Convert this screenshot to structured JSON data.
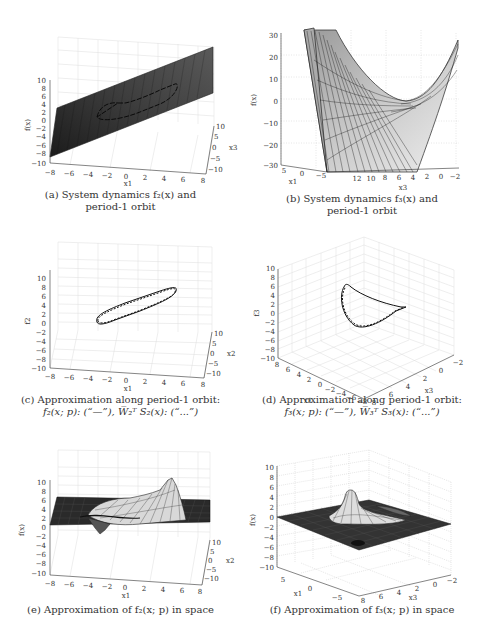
{
  "figure": {
    "panels": [
      {
        "id": "a",
        "caption_line1": "(a) System dynamics f₂(x) and",
        "caption_line2": "period-1 orbit",
        "zlabel": "f(x)",
        "xlabel": "x1",
        "ylabel": "x3",
        "zticks": [
          "10",
          "8",
          "6",
          "4",
          "2",
          "0",
          "−2",
          "−4",
          "−6",
          "−8",
          "−10"
        ],
        "xticks": [
          "−8",
          "−6",
          "−4",
          "−2",
          "0",
          "2",
          "4",
          "6",
          "8"
        ],
        "yticks": [
          "10",
          "5",
          "0",
          "−5",
          "−10"
        ]
      },
      {
        "id": "b",
        "caption_line1": "(b) System dynamics f₃(x) and",
        "caption_line2": "period-1 orbit",
        "zlabel": "f(x)",
        "xlabel": "x1",
        "ylabel": "x3",
        "zticks": [
          "30",
          "20",
          "10",
          "0",
          "−10",
          "−20",
          "−30"
        ],
        "xticks": [
          "5",
          "0",
          "−5"
        ],
        "yticks": [
          "12",
          "10",
          "8",
          "6",
          "4",
          "2",
          "0",
          "−2"
        ]
      },
      {
        "id": "c",
        "caption_line1": "(c) Approximation along period-1 orbit:",
        "caption_line2": "f₂(x; p): (“—”), W̅₂ᵀ S₂(x): (“...”)",
        "zlabel": "f2",
        "xlabel": "x1",
        "ylabel": "x2",
        "zticks": [
          "10",
          "8",
          "6",
          "4",
          "2",
          "0",
          "−2",
          "−4",
          "−6",
          "−8",
          "−10"
        ],
        "xticks": [
          "−8",
          "−6",
          "−4",
          "−2",
          "0",
          "2",
          "4",
          "6",
          "8"
        ],
        "yticks": [
          "10",
          "5",
          "0",
          "−5",
          "−10"
        ]
      },
      {
        "id": "d",
        "caption_line1": "(d) Approximation along period-1 orbit:",
        "caption_line2": "f₃(x; p): (“—”), W̅₃ᵀ S₃(x): (“...”)",
        "zlabel": "f3",
        "xlabel": "x1",
        "ylabel": "x3",
        "zticks": [
          "10",
          "8",
          "6",
          "4",
          "2",
          "0",
          "−2",
          "−4",
          "−6",
          "−8",
          "−10"
        ],
        "xticks": [
          "8",
          "6",
          "4",
          "2",
          "0",
          "−2",
          "−4",
          "−6",
          "−8"
        ],
        "yticks": [
          "8",
          "6",
          "4",
          "2",
          "0",
          "−2"
        ]
      },
      {
        "id": "e",
        "caption_line1": "(e) Approximation of f₂(x; p) in space",
        "caption_line2": "",
        "zlabel": "f(x)",
        "xlabel": "x1",
        "ylabel": "x2",
        "zticks": [
          "10",
          "8",
          "6",
          "4",
          "2",
          "0",
          "−2",
          "−4",
          "−6",
          "−8",
          "−10"
        ],
        "xticks": [
          "−8",
          "−6",
          "−4",
          "−2",
          "0",
          "2",
          "4",
          "6",
          "8"
        ],
        "yticks": [
          "10",
          "5",
          "0",
          "−5",
          "−10"
        ]
      },
      {
        "id": "f",
        "caption_line1": "(f) Approximation of f₃(x; p) in space",
        "caption_line2": "",
        "zlabel": "f(x)",
        "xlabel": "x1",
        "ylabel": "x3",
        "zticks": [
          "10",
          "8",
          "6",
          "4",
          "2",
          "0",
          "−2",
          "−4",
          "−6",
          "−8",
          "−10"
        ],
        "xticks": [
          "5",
          "0",
          "−5"
        ],
        "yticks": [
          "8",
          "6",
          "4",
          "2",
          "0",
          "−2"
        ]
      }
    ]
  }
}
